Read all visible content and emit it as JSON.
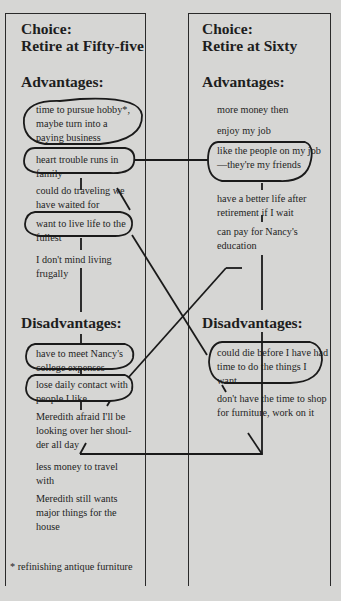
{
  "left": {
    "choice_label": "Choice:",
    "choice_title": "Retire at Fifty-five",
    "advantages_heading": "Advantages:",
    "advantages": [
      "time to pursue hobby*, maybe turn into a paying business",
      "heart trouble runs in family",
      "could do traveling we have waited for",
      "want to live life to the fullest",
      "I don't mind living frugally"
    ],
    "disadvantages_heading": "Disadvantages:",
    "disadvantages": [
      "have to meet Nancy's college expenses",
      "lose daily contact with people I like",
      "Meredith afraid I'll be looking over her shoul-der all day",
      "less money to travel with",
      "Meredith still wants major things for the house"
    ],
    "footnote": "* refinishing antique furniture"
  },
  "right": {
    "choice_label": "Choice:",
    "choice_title": "Retire at Sixty",
    "advantages_heading": "Advantages:",
    "advantages": [
      "more money then",
      "enjoy my job",
      "like the people on my job—they're my friends",
      "have a better life after retirement if I wait",
      "can pay for Nancy's education"
    ],
    "disadvantages_heading": "Disadvantages:",
    "disadvantages": [
      "could die before I have had time to do the things I want",
      "don't have the time to shop for furniture, work on it"
    ]
  }
}
